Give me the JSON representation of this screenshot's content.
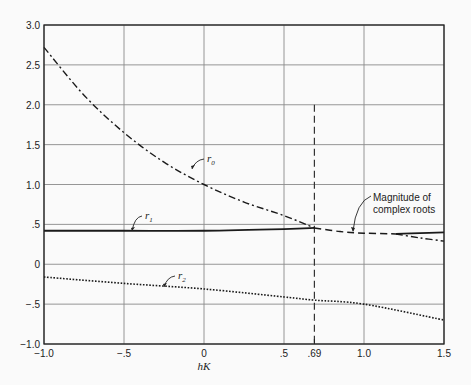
{
  "chart_data": {
    "type": "line",
    "title": "",
    "xlabel": "hK",
    "ylabel": "",
    "xlim": [
      -1.0,
      1.5
    ],
    "ylim": [
      -1.0,
      3.0
    ],
    "grid": true,
    "x_ticks": [
      {
        "value": -1.0,
        "label": "−1.0"
      },
      {
        "value": -0.5,
        "label": "−.5"
      },
      {
        "value": 0,
        "label": "0"
      },
      {
        "value": 0.5,
        "label": ".5"
      },
      {
        "value": 0.69,
        "label": ".69"
      },
      {
        "value": 1.0,
        "label": "1.0"
      },
      {
        "value": 1.5,
        "label": "1.5"
      }
    ],
    "y_ticks": [
      {
        "value": 3.0,
        "label": "3.0"
      },
      {
        "value": 2.5,
        "label": "2.5"
      },
      {
        "value": 2.0,
        "label": "2.0"
      },
      {
        "value": 1.5,
        "label": "1.5"
      },
      {
        "value": 1.0,
        "label": "1.0"
      },
      {
        "value": 0.5,
        "label": ".5"
      },
      {
        "value": 0,
        "label": "0"
      },
      {
        "value": -0.5,
        "label": "−.5"
      },
      {
        "value": -1.0,
        "label": "−1.0"
      }
    ],
    "series": [
      {
        "name": "r0",
        "label": "r",
        "subscript": "0",
        "style": "dash-dot",
        "x": [
          -1.0,
          -0.75,
          -0.5,
          -0.25,
          0,
          0.25,
          0.5,
          0.69
        ],
        "values": [
          2.72,
          2.12,
          1.65,
          1.28,
          1.0,
          0.78,
          0.61,
          0.455
        ]
      },
      {
        "name": "r1",
        "label": "r",
        "subscript": "1",
        "style": "solid",
        "x": [
          -1.0,
          -0.5,
          0,
          0.5,
          0.69
        ],
        "values": [
          0.42,
          0.42,
          0.42,
          0.44,
          0.455
        ]
      },
      {
        "name": "r2",
        "label": "r",
        "subscript": "2",
        "style": "dotted",
        "x": [
          -1.0,
          -0.5,
          0,
          0.5,
          0.69,
          1.0,
          1.5
        ],
        "values": [
          -0.16,
          -0.24,
          -0.31,
          -0.41,
          -0.45,
          -0.5,
          -0.7
        ]
      },
      {
        "name": "magnitude_of_complex_roots",
        "label": "Magnitude of complex roots",
        "style": "dashed",
        "x": [
          0.69,
          0.85,
          1.0,
          1.2
        ],
        "values": [
          0.455,
          0.41,
          0.39,
          0.38
        ]
      },
      {
        "name": "r1_beyond",
        "style": "solid",
        "x": [
          1.2,
          1.35,
          1.5
        ],
        "values": [
          0.38,
          0.39,
          0.4
        ]
      },
      {
        "name": "r0_beyond",
        "style": "dash-dot",
        "x": [
          1.2,
          1.35,
          1.5
        ],
        "values": [
          0.38,
          0.33,
          0.29
        ]
      }
    ],
    "annotations": [
      {
        "text": "r",
        "subscript": "0",
        "x": -0.15,
        "y": 1.3
      },
      {
        "text": "r",
        "subscript": "1",
        "x": -0.38,
        "y": 0.58
      },
      {
        "text": "r",
        "subscript": "2",
        "x": -0.22,
        "y": -0.14
      },
      {
        "text_line1": "Magnitude of",
        "text_line2": "complex roots",
        "x": 0.97,
        "y": 0.62
      },
      {
        "text": "vertical dashed line",
        "x": 0.69,
        "y_from": 2.0,
        "y_to": -1.0
      }
    ]
  }
}
